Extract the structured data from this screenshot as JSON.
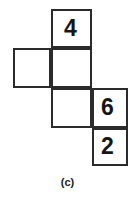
{
  "figure": {
    "type": "cube-net-diagram",
    "caption": "(c)",
    "background_color": "#ffffff",
    "line_color": "#2b2b2b",
    "text_color": "#161616",
    "grid": {
      "columns": 3,
      "rows": 4,
      "cell_size_px": 40
    },
    "cells": [
      {
        "id": "top",
        "row": 1,
        "col": 2,
        "label": "4",
        "has_label": true
      },
      {
        "id": "mid-left",
        "row": 2,
        "col": 1,
        "label": "",
        "has_label": false
      },
      {
        "id": "mid-ctr",
        "row": 2,
        "col": 2,
        "label": "",
        "has_label": false
      },
      {
        "id": "low-left",
        "row": 3,
        "col": 2,
        "label": "",
        "has_label": false
      },
      {
        "id": "low-rt",
        "row": 3,
        "col": 3,
        "label": "6",
        "has_label": true
      },
      {
        "id": "bottom",
        "row": 4,
        "col": 3,
        "label": "2",
        "has_label": true
      }
    ],
    "labels": {
      "top": "4",
      "right": "6",
      "bottom": "2"
    }
  }
}
